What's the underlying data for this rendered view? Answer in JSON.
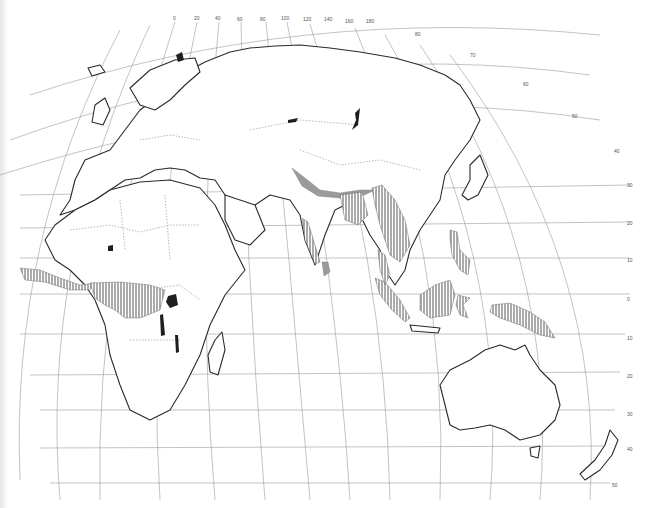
{
  "map": {
    "type": "distribution map (Old World, Eckert-like projection)",
    "colors": {
      "background": "#ffffff",
      "coastline": "#2a2a2a",
      "graticule": "#9a9a9a",
      "hatch": "#444444",
      "stipple_shade": "#9b9b9b",
      "solid_fill": "#1e1e1e"
    },
    "longitude_labels": [
      "0",
      "20",
      "40",
      "60",
      "80",
      "100",
      "120",
      "140",
      "160",
      "180"
    ],
    "latitude_labels_north": [
      "80",
      "70",
      "60",
      "50",
      "40",
      "30",
      "20",
      "10"
    ],
    "latitude_label_equator": "0",
    "latitude_labels_south": [
      "10",
      "20",
      "30",
      "40",
      "50"
    ],
    "legend_regions": [
      {
        "name": "West African coastal forest",
        "style": "hatched"
      },
      {
        "name": "Congo basin",
        "style": "hatched"
      },
      {
        "name": "East African lakes",
        "style": "solid"
      },
      {
        "name": "Himalayan foothills",
        "style": "shaded"
      },
      {
        "name": "Western Ghats",
        "style": "hatched"
      },
      {
        "name": "Sri Lanka",
        "style": "shaded"
      },
      {
        "name": "Northeast India / Bangladesh",
        "style": "hatched"
      },
      {
        "name": "Indochina",
        "style": "hatched"
      },
      {
        "name": "Malay Peninsula",
        "style": "hatched"
      },
      {
        "name": "Sumatra",
        "style": "hatched"
      },
      {
        "name": "Borneo",
        "style": "hatched"
      },
      {
        "name": "Philippines",
        "style": "hatched"
      },
      {
        "name": "Sulawesi",
        "style": "hatched"
      },
      {
        "name": "New Guinea",
        "style": "hatched"
      }
    ]
  }
}
